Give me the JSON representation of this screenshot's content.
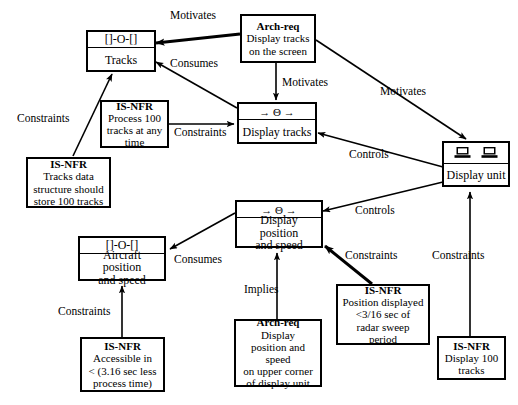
{
  "diagram": {
    "nodes": {
      "tracks_store": {
        "icon": "data-store-icon",
        "icon_text": "[]-O-[]",
        "label": "Tracks"
      },
      "arch_req_display_tracks": {
        "kind": "Arch-req",
        "body": "Display tracks\non the screen"
      },
      "nfr_process_100": {
        "kind": "IS-NFR",
        "body": "Process 100\ntracks at any\ntime"
      },
      "nfr_tracks_data": {
        "kind": "IS-NFR",
        "body": "Tracks data\nstructure should\nstore 100 tracks"
      },
      "display_tracks_process": {
        "icon": "process-transform-icon",
        "icon_text": "→ Θ →",
        "label": "Display tracks"
      },
      "display_unit": {
        "icon": "two-monitors-icon",
        "label": "Display unit"
      },
      "display_position_process": {
        "icon": "process-transform-icon",
        "icon_text": "→ Θ →",
        "label": "Display position\nand speed"
      },
      "aircraft_store": {
        "icon": "data-store-icon",
        "icon_text": "[]-O-[]",
        "label": "Aircraft position\nand speed"
      },
      "nfr_accessible": {
        "kind": "IS-NFR",
        "body": "Accessible in\n< (3.16 sec less\nprocess time)"
      },
      "arch_req_display_position": {
        "kind": "Arch-req",
        "body": "Display\nposition and speed\non upper corner\nof display unit"
      },
      "nfr_position_displayed": {
        "kind": "IS-NFR",
        "body": "Position displayed\n<3/16 sec of\nradar sweep\nperiod"
      },
      "nfr_display_100": {
        "kind": "IS-NFR",
        "body": "Display 100\ntracks"
      }
    },
    "edges": [
      {
        "id": "e1",
        "from": "arch_req_display_tracks",
        "to": "tracks_store",
        "label": "Motivates"
      },
      {
        "id": "e2",
        "from": "display_tracks_process",
        "to": "tracks_store",
        "label": "Consumes"
      },
      {
        "id": "e3",
        "from": "arch_req_display_tracks",
        "to": "display_tracks_process",
        "label": "Motivates"
      },
      {
        "id": "e4",
        "from": "arch_req_display_tracks",
        "to": "display_unit",
        "label": "Motivates"
      },
      {
        "id": "e5",
        "from": "nfr_process_100",
        "to": "display_tracks_process",
        "label": "Constraints"
      },
      {
        "id": "e6",
        "from": "nfr_tracks_data",
        "to": "tracks_store",
        "label": "Constraints"
      },
      {
        "id": "e7",
        "from": "display_unit",
        "to": "display_tracks_process",
        "label": "Controls"
      },
      {
        "id": "e8",
        "from": "display_unit",
        "to": "display_position_process",
        "label": "Controls"
      },
      {
        "id": "e9",
        "from": "display_position_process",
        "to": "aircraft_store",
        "label": "Consumes"
      },
      {
        "id": "e10",
        "from": "nfr_accessible",
        "to": "aircraft_store",
        "label": "Constraints"
      },
      {
        "id": "e11",
        "from": "arch_req_display_position",
        "to": "display_position_process",
        "label": "Implies"
      },
      {
        "id": "e12",
        "from": "nfr_position_displayed",
        "to": "display_position_process",
        "label": "Constraints"
      },
      {
        "id": "e13",
        "from": "nfr_display_100",
        "to": "display_unit",
        "label": "Constraints"
      }
    ],
    "edge_labels": {
      "motivates_tracks": "Motivates",
      "consumes_tracks": "Consumes",
      "motivates_display_tracks": "Motivates",
      "motivates_display_unit": "Motivates",
      "constraints_process100": "Constraints",
      "constraints_tracksdata": "Constraints",
      "controls_display_tracks": "Controls",
      "controls_display_position": "Controls",
      "consumes_aircraft": "Consumes",
      "constraints_accessible": "Constraints",
      "implies_position": "Implies",
      "constraints_position_displayed": "Constraints",
      "constraints_display100": "Constraints"
    },
    "colors": {
      "stroke": "#000000",
      "background": "#ffffff",
      "text": "#000000"
    }
  }
}
